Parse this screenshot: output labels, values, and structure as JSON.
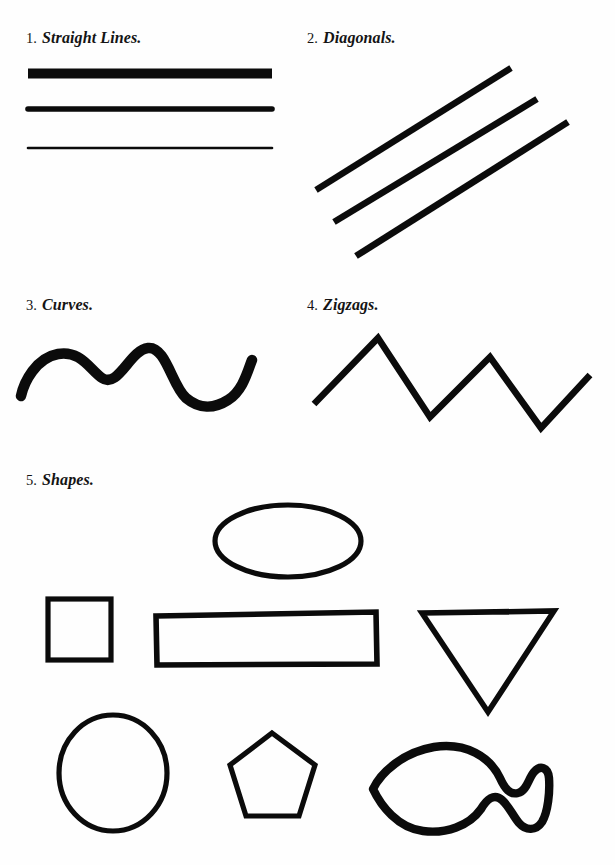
{
  "page": {
    "background_color": "#fefefe",
    "ink_color": "#0b0b0b",
    "width": 615,
    "height": 865
  },
  "sections": [
    {
      "id": "straight-lines",
      "number": "1.",
      "name": "Straight Lines.",
      "figure": "three horizontal lines of decreasing thickness"
    },
    {
      "id": "diagonals",
      "number": "2.",
      "name": "Diagonals.",
      "figure": "three parallel diagonal strokes rising to the right"
    },
    {
      "id": "curves",
      "number": "3.",
      "name": "Curves.",
      "figure": "thick wavy line with two crests and one trough"
    },
    {
      "id": "zigzags",
      "number": "4.",
      "name": "Zigzags.",
      "figure": "sharp angular zigzag with two peaks and two valleys"
    },
    {
      "id": "shapes",
      "number": "5.",
      "name": "Shapes.",
      "figure": "ellipse, square, rectangle, inverted triangle, circle, pentagon, fish outline"
    }
  ],
  "shapes": [
    {
      "id": "ellipse",
      "label": "ellipse"
    },
    {
      "id": "square",
      "label": "square"
    },
    {
      "id": "rectangle",
      "label": "rectangle"
    },
    {
      "id": "triangle",
      "label": "inverted triangle"
    },
    {
      "id": "circle",
      "label": "circle"
    },
    {
      "id": "pentagon",
      "label": "pentagon"
    },
    {
      "id": "fish",
      "label": "fish"
    }
  ]
}
